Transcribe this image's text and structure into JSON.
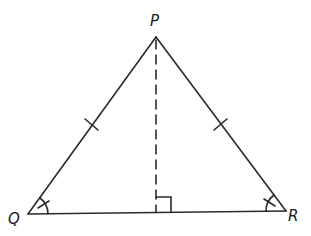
{
  "diagram": {
    "type": "isosceles-triangle",
    "stroke_color": "#2a2a2a",
    "vertices": [
      {
        "id": "P",
        "label": "P",
        "x": 156,
        "y": 37,
        "label_x": 150,
        "label_y": 26
      },
      {
        "id": "Q",
        "label": "Q",
        "x": 28,
        "y": 214,
        "label_x": 8,
        "label_y": 224
      },
      {
        "id": "R",
        "label": "R",
        "x": 286,
        "y": 211,
        "label_x": 288,
        "label_y": 221
      }
    ],
    "sides": [
      {
        "from": "P",
        "to": "Q",
        "tick_marks": 1
      },
      {
        "from": "P",
        "to": "R",
        "tick_marks": 1
      },
      {
        "from": "Q",
        "to": "R",
        "tick_marks": 0
      }
    ],
    "altitude": {
      "from": "P",
      "foot_x": 156,
      "foot_y": 212,
      "style": "dashed",
      "right_angle_mark": true
    },
    "angle_marks": [
      {
        "vertex": "Q",
        "arcs": 1,
        "tick": 1
      },
      {
        "vertex": "R",
        "arcs": 1,
        "tick": 1
      }
    ]
  }
}
